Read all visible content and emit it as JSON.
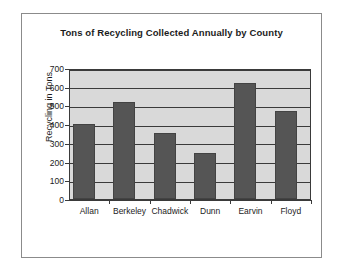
{
  "chart_data": {
    "type": "bar",
    "title": "Tons of Recycling Collected Annually by County",
    "xlabel": "",
    "ylabel": "Recycling in Tons",
    "categories": [
      "Allan",
      "Berkeley",
      "Chadwick",
      "Dunn",
      "Earvin",
      "Floyd"
    ],
    "values": [
      400,
      520,
      355,
      245,
      620,
      470
    ],
    "ylim": [
      0,
      700
    ],
    "ytick_labels": [
      "0",
      "100",
      "200",
      "300",
      "400",
      "500",
      "600",
      "700"
    ],
    "ytick_values": [
      0,
      100,
      200,
      300,
      400,
      500,
      600,
      700
    ],
    "grid": true,
    "legend": null,
    "bar_color": "#555555",
    "plot_background": "#d9d9d9",
    "axis_color": "#3a3a3a",
    "figure_background": "#ffffff"
  }
}
